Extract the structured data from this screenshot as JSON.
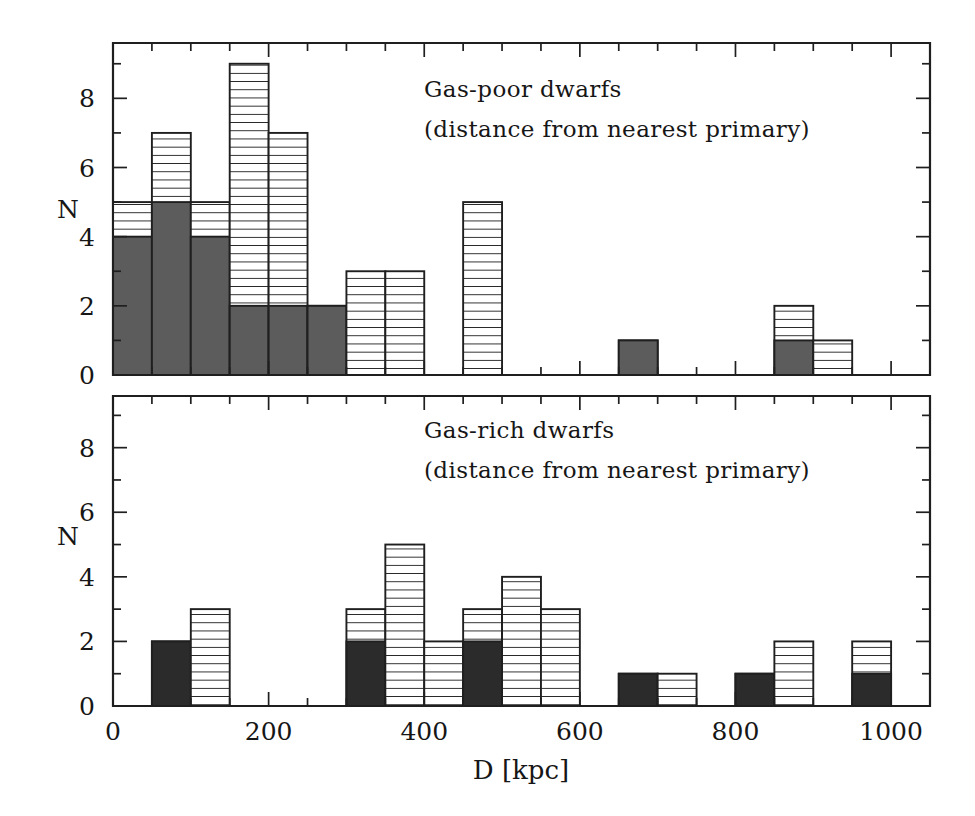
{
  "figure": {
    "title": "",
    "background_color": "#ffffff",
    "ink_color": "#1f1f1f",
    "solid_fill_color": "#5c5c5c",
    "solid_fill_color_bottom": "#2b2b2b",
    "hatch_fill_color": "#ffffff",
    "hatch_line_color": "#1f1f1f"
  },
  "axis": {
    "x_title": "D [kpc]",
    "x_ticks": [
      0,
      200,
      400,
      600,
      800,
      1000
    ],
    "x_tick_labels": [
      "0",
      "200",
      "400",
      "600",
      "800",
      "1000"
    ],
    "x_min": 0,
    "x_max": 1050,
    "x_minor_step": 50,
    "y_ticks": [
      0,
      2,
      4,
      6,
      8
    ],
    "y_tick_labels": [
      "0",
      "2",
      "4",
      "6",
      "8"
    ],
    "y_min": 0,
    "y_max": 9.6,
    "y_minor_step": 1,
    "y_title": "N"
  },
  "panels": [
    {
      "id": "top",
      "y_axis_label": "N",
      "annotation_line1": "Gas-poor dwarfs",
      "annotation_line2": "(distance from nearest primary)"
    },
    {
      "id": "bottom",
      "y_axis_label": "N",
      "annotation_line1": "Gas-rich dwarfs",
      "annotation_line2": "(distance from nearest primary)"
    }
  ],
  "chart_data": [
    {
      "type": "bar",
      "id": "gas-poor",
      "title": "Gas-poor dwarfs",
      "subtitle": "(distance from nearest primary)",
      "xlabel": "D [kpc]",
      "ylabel": "N",
      "xlim": [
        0,
        1050
      ],
      "ylim": [
        0,
        9.6
      ],
      "grid": false,
      "bin_width": 50,
      "bin_starts": [
        0,
        50,
        100,
        150,
        200,
        250,
        300,
        350,
        400,
        450,
        500,
        550,
        600,
        650,
        700,
        750,
        800,
        850,
        900,
        950,
        1000
      ],
      "series": [
        {
          "name": "total",
          "style": "horizontal-hatch",
          "values": [
            5,
            7,
            5,
            9,
            7,
            2,
            3,
            3,
            0,
            5,
            0,
            0,
            0,
            1,
            0,
            0,
            0,
            2,
            1,
            0,
            0
          ]
        },
        {
          "name": "subset-solid",
          "style": "solid-gray",
          "values": [
            4,
            5,
            4,
            2,
            2,
            2,
            0,
            0,
            0,
            0,
            0,
            0,
            0,
            1,
            0,
            0,
            0,
            1,
            0,
            0,
            0
          ]
        }
      ]
    },
    {
      "type": "bar",
      "id": "gas-rich",
      "title": "Gas-rich dwarfs",
      "subtitle": "(distance from nearest primary)",
      "xlabel": "D [kpc]",
      "ylabel": "N",
      "xlim": [
        0,
        1050
      ],
      "ylim": [
        0,
        9.6
      ],
      "grid": false,
      "bin_width": 50,
      "bin_starts": [
        0,
        50,
        100,
        150,
        200,
        250,
        300,
        350,
        400,
        450,
        500,
        550,
        600,
        650,
        700,
        750,
        800,
        850,
        900,
        950,
        1000
      ],
      "series": [
        {
          "name": "total",
          "style": "horizontal-hatch",
          "values": [
            0,
            2,
            3,
            0,
            0,
            0,
            3,
            5,
            2,
            3,
            4,
            3,
            0,
            1,
            1,
            0,
            1,
            2,
            0,
            2,
            0
          ]
        },
        {
          "name": "subset-solid",
          "style": "solid-black",
          "values": [
            0,
            2,
            0,
            0,
            0,
            0,
            2,
            0,
            0,
            2,
            0,
            0,
            0,
            1,
            0,
            0,
            1,
            0,
            0,
            1,
            0
          ]
        }
      ]
    }
  ]
}
